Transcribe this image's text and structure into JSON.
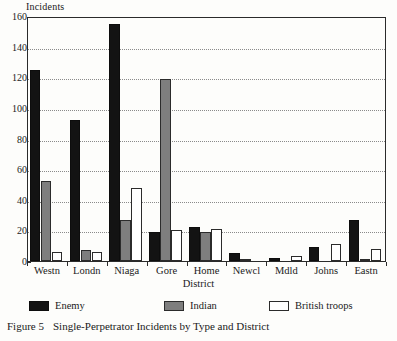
{
  "chart_data": {
    "type": "bar",
    "title": "",
    "xlabel": "District",
    "ylabel": "Incidents",
    "ylim": [
      0,
      160
    ],
    "yticks": [
      0,
      20,
      40,
      60,
      80,
      100,
      120,
      140,
      160
    ],
    "grid": "horizontal-dotted",
    "legend_position": "below-axis",
    "categories": [
      "Westn",
      "Londn",
      "Niaga",
      "Gore",
      "Home",
      "Newcl",
      "Mdld",
      "Johns",
      "Eastn"
    ],
    "series": [
      {
        "name": "Enemy",
        "color": "#131313",
        "values": [
          125,
          92,
          155,
          19,
          22,
          5,
          2,
          9,
          27
        ]
      },
      {
        "name": "Indian",
        "color": "#7e7e7e",
        "values": [
          52,
          7,
          27,
          119,
          19,
          1,
          0,
          0,
          1
        ]
      },
      {
        "name": "British troops",
        "color": "#ffffff",
        "values": [
          6,
          6,
          48,
          20,
          21,
          0,
          3,
          11,
          8
        ]
      }
    ]
  },
  "caption": {
    "figure_label": "Figure 5",
    "text": "Single-Perpetrator Incidents by Type and District"
  }
}
